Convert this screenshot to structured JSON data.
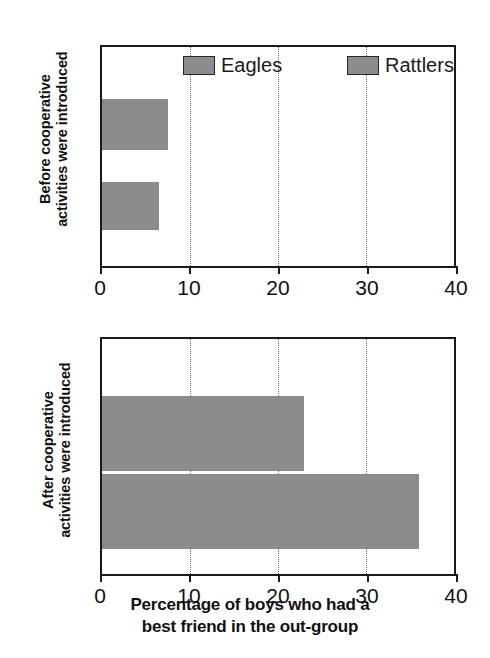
{
  "chart_data": {
    "type": "bar",
    "orientation": "horizontal",
    "title": "",
    "xlabel_line1": "Percentage of boys who had a",
    "xlabel_line2": "best friend in the out-group",
    "xlabel": "Percentage of boys who had a best friend in the out-group",
    "xlim": [
      0,
      40
    ],
    "xticks": [
      0,
      10,
      20,
      30,
      40
    ],
    "xticklabels": [
      "0",
      "10",
      "20",
      "30",
      "40"
    ],
    "gridlines": [
      10,
      20,
      30
    ],
    "grid": true,
    "legend": [
      "Eagles",
      "Rattlers"
    ],
    "legend_position": "top-inside",
    "series_color": "#8c8c8c",
    "panels": [
      {
        "ylabel_line1": "Before cooperative",
        "ylabel_line2": "activities were introduced",
        "ylabel": "Before cooperative activities were introduced",
        "categories": [
          "Eagles",
          "Rattlers"
        ],
        "values": [
          7.5,
          6.5
        ]
      },
      {
        "ylabel_line1": "After cooperative",
        "ylabel_line2": "activities were introduced",
        "ylabel": "After cooperative activities were introduced",
        "categories": [
          "Eagles",
          "Rattlers"
        ],
        "values": [
          23,
          36
        ]
      }
    ]
  },
  "colors": {
    "bar_fill": "#8c8c8c",
    "axis": "#1a1a1a",
    "grid": "#6a6a6a",
    "text": "#111111",
    "background": "#ffffff"
  }
}
